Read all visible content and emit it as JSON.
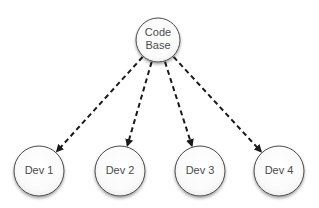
{
  "diagram": {
    "type": "tree",
    "root": {
      "id": "code-base",
      "label_lines": [
        "Code",
        "Base"
      ],
      "cx": 158,
      "cy": 40,
      "r": 22
    },
    "children": [
      {
        "id": "dev-1",
        "label": "Dev 1",
        "cx": 39,
        "cy": 171,
        "r": 25
      },
      {
        "id": "dev-2",
        "label": "Dev 2",
        "cx": 120,
        "cy": 171,
        "r": 25
      },
      {
        "id": "dev-3",
        "label": "Dev 3",
        "cx": 200,
        "cy": 171,
        "r": 25
      },
      {
        "id": "dev-4",
        "label": "Dev 4",
        "cx": 279,
        "cy": 171,
        "r": 25
      }
    ],
    "edges": [
      {
        "from": "code-base",
        "to": "dev-1",
        "style": "dashed-arrow"
      },
      {
        "from": "code-base",
        "to": "dev-2",
        "style": "dashed-arrow"
      },
      {
        "from": "code-base",
        "to": "dev-3",
        "style": "dashed-arrow"
      },
      {
        "from": "code-base",
        "to": "dev-4",
        "style": "dashed-arrow"
      }
    ],
    "colors": {
      "stroke": "#4a4a4a",
      "edge": "#1a1a1a",
      "text": "#4a4a4a",
      "fill_center": "#ffffff",
      "fill_edge": "#f2f2f2"
    }
  }
}
